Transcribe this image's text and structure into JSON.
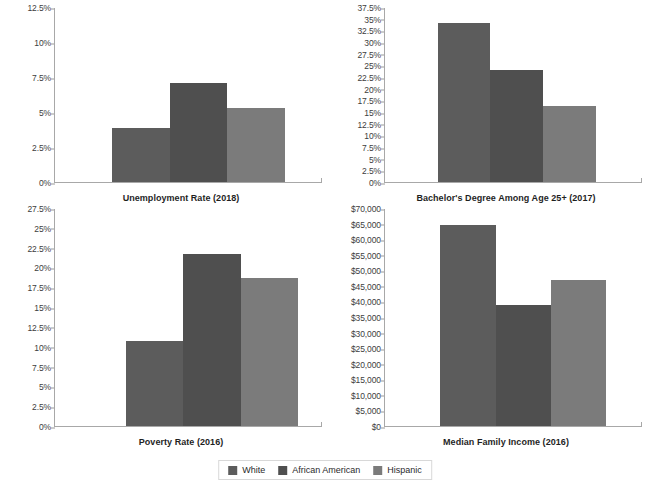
{
  "colors": {
    "white_bar": "#5c5c5c",
    "african_american_bar": "#4f4f4f",
    "hispanic_bar": "#7b7b7b",
    "axis": "#a8a8a8",
    "text": "#333333",
    "background": "#ffffff"
  },
  "legend": {
    "position": "bottom-center",
    "items": [
      {
        "label": "White",
        "color": "#5c5c5c",
        "swatch_name": "legend-swatch-white"
      },
      {
        "label": "African American",
        "color": "#4f4f4f",
        "swatch_name": "legend-swatch-african-american"
      },
      {
        "label": "Hispanic",
        "color": "#7b7b7b",
        "swatch_name": "legend-swatch-hispanic"
      }
    ]
  },
  "chart_data": [
    {
      "type": "bar",
      "title": "Unemployment Rate (2018)",
      "title_position": "below-axis",
      "xlabel": "",
      "ylabel": "",
      "categories": [
        "White",
        "African American",
        "Hispanic"
      ],
      "values": [
        3.9,
        7.1,
        5.3
      ],
      "value_unit": "percent",
      "ylim": [
        0,
        12.5
      ],
      "ytick_labels": [
        "0%",
        "2.5%",
        "5%",
        "7.5%",
        "10%",
        "12.5%"
      ],
      "ytick_values": [
        0,
        2.5,
        5,
        7.5,
        10,
        12.5
      ],
      "grid": false,
      "legend_position": "figure-bottom"
    },
    {
      "type": "bar",
      "title": "Bachelor's Degree Among Age 25+ (2017)",
      "title_position": "below-axis",
      "xlabel": "",
      "ylabel": "",
      "categories": [
        "White",
        "African American",
        "Hispanic"
      ],
      "values": [
        34.2,
        24.1,
        16.4
      ],
      "value_unit": "percent",
      "ylim": [
        0,
        37.5
      ],
      "ytick_labels": [
        "0%",
        "2.5%",
        "5%",
        "7.5%",
        "10%",
        "12.5%",
        "15%",
        "17.5%",
        "20%",
        "22.5%",
        "25%",
        "27.5%",
        "30%",
        "32.5%",
        "35%",
        "37.5%"
      ],
      "ytick_values": [
        0,
        2.5,
        5,
        7.5,
        10,
        12.5,
        15,
        17.5,
        20,
        22.5,
        25,
        27.5,
        30,
        32.5,
        35,
        37.5
      ],
      "grid": false,
      "legend_position": "figure-bottom"
    },
    {
      "type": "bar",
      "title": "Poverty Rate (2016)",
      "title_position": "below-axis",
      "xlabel": "",
      "ylabel": "",
      "categories": [
        "White",
        "African American",
        "Hispanic"
      ],
      "values": [
        10.8,
        21.8,
        18.7
      ],
      "value_unit": "percent",
      "ylim": [
        0,
        27.5
      ],
      "ytick_labels": [
        "0%",
        "2.5%",
        "5%",
        "7.5%",
        "10%",
        "12.5%",
        "15%",
        "17.5%",
        "20%",
        "22.5%",
        "25%",
        "27.5%"
      ],
      "ytick_values": [
        0,
        2.5,
        5,
        7.5,
        10,
        12.5,
        15,
        17.5,
        20,
        22.5,
        25,
        27.5
      ],
      "grid": false,
      "legend_position": "figure-bottom"
    },
    {
      "type": "bar",
      "title": "Median Family Income (2016)",
      "title_position": "below-axis",
      "xlabel": "",
      "ylabel": "",
      "categories": [
        "White",
        "African American",
        "Hispanic"
      ],
      "values": [
        64800,
        39000,
        47000
      ],
      "value_unit": "usd",
      "ylim": [
        0,
        70000
      ],
      "ytick_labels": [
        "$0",
        "$5,000",
        "$10,000",
        "$15,000",
        "$20,000",
        "$25,000",
        "$30,000",
        "$35,000",
        "$40,000",
        "$45,000",
        "$50,000",
        "$55,000",
        "$60,000",
        "$65,000",
        "$70,000"
      ],
      "ytick_values": [
        0,
        5000,
        10000,
        15000,
        20000,
        25000,
        30000,
        35000,
        40000,
        45000,
        50000,
        55000,
        60000,
        65000,
        70000
      ],
      "grid": false,
      "legend_position": "figure-bottom"
    }
  ]
}
